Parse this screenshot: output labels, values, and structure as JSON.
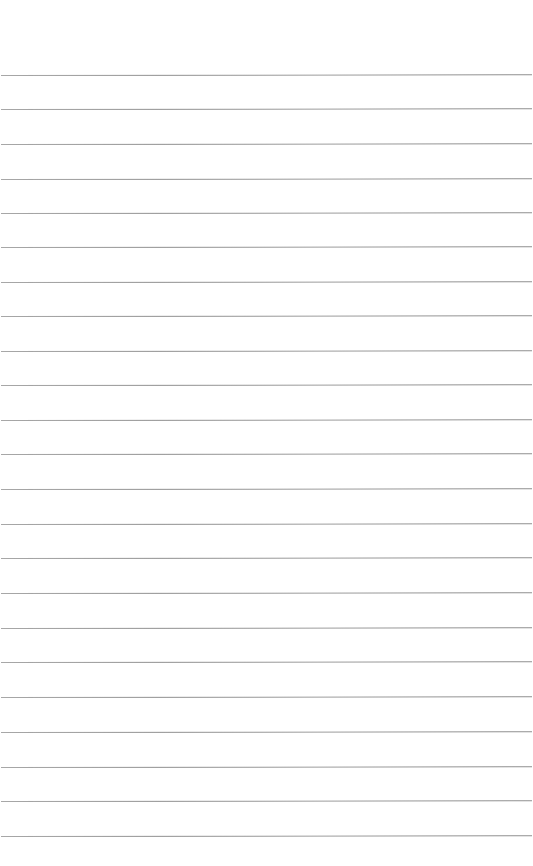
{
  "page": {
    "type": "lined-paper",
    "background_color": "#ffffff",
    "line_color": "#9a9a9a",
    "line_count": 23,
    "line_positions_y": [
      75,
      109,
      144,
      179,
      213,
      247,
      282,
      316,
      351,
      385,
      420,
      454,
      489,
      524,
      558,
      593,
      628,
      662,
      697,
      732,
      767,
      801,
      836
    ]
  }
}
